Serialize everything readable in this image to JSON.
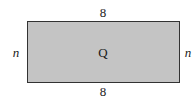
{
  "diagram": {
    "type": "rectangle",
    "shape_label": "Q",
    "top_side_label": "8",
    "bottom_side_label": "8",
    "left_side_label": "n",
    "right_side_label": "n",
    "fill_color": "#c4c4c4",
    "stroke_color": "#333333"
  }
}
